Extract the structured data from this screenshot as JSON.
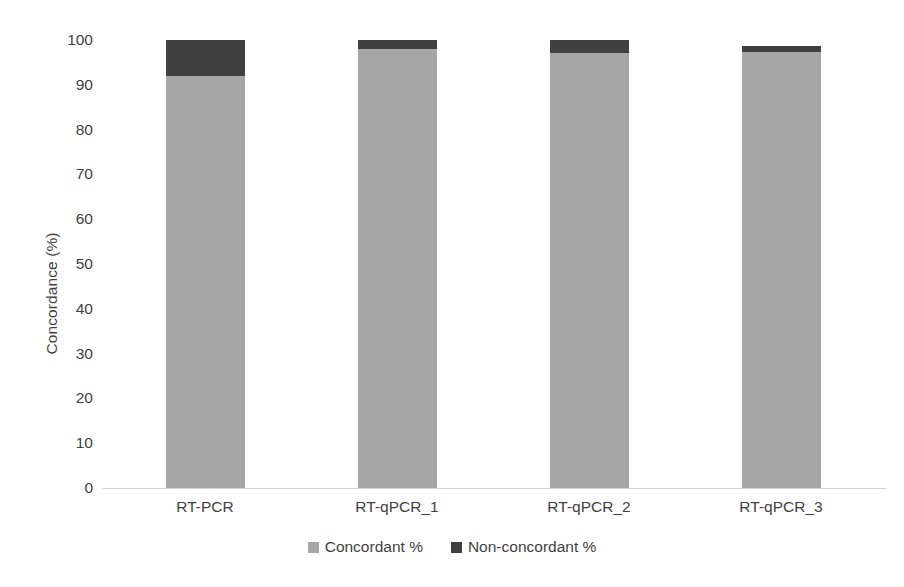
{
  "chart_data": {
    "type": "bar",
    "subtype": "stacked-column-100",
    "title": "",
    "xlabel": "",
    "ylabel": "Concordance (%)",
    "ylim": [
      0,
      100
    ],
    "yticks": [
      0,
      10,
      20,
      30,
      40,
      50,
      60,
      70,
      80,
      90,
      100
    ],
    "ytick_labels": [
      "0",
      "10",
      "20",
      "30",
      "40",
      "50",
      "60",
      "70",
      "80",
      "90",
      "100"
    ],
    "grid": false,
    "legend_position": "bottom-center",
    "categories": [
      "RT-PCR",
      "RT-qPCR_1",
      "RT-qPCR_2",
      "RT-qPCR_3"
    ],
    "series": [
      {
        "name": "Concordant %",
        "color": "#a6a6a6",
        "values": [
          92.0,
          98.0,
          97.0,
          97.3
        ]
      },
      {
        "name": "Non-concordant %",
        "color": "#404040",
        "values": [
          8.0,
          2.0,
          3.0,
          1.4
        ]
      }
    ],
    "annotations": []
  },
  "axes": {
    "y_title": "Concordance (%)",
    "y_ticks": [
      "100",
      "90",
      "80",
      "70",
      "60",
      "50",
      "40",
      "30",
      "20",
      "10",
      "0"
    ],
    "x_ticks": [
      "RT-PCR",
      "RT-qPCR_1",
      "RT-qPCR_2",
      "RT-qPCR_3"
    ]
  },
  "legend": {
    "entries": [
      {
        "label": "Concordant %",
        "color": "#a6a6a6"
      },
      {
        "label": "Non-concordant %",
        "color": "#404040"
      }
    ]
  },
  "colors": {
    "concordant": "#a6a6a6",
    "non_concordant": "#404040",
    "axis_line": "#d4d4d4",
    "text": "#3f3f3f",
    "background": "#ffffff"
  }
}
